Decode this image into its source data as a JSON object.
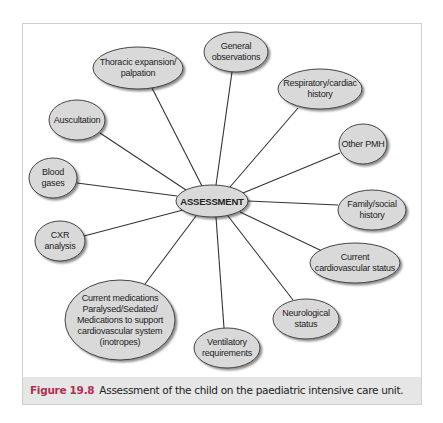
{
  "figure": {
    "number": "Figure 19.8",
    "caption": "Assessment of the child on the paediatric intensive care unit."
  },
  "colors": {
    "node_fill": "#d9d9d9",
    "node_stroke": "#333333",
    "edge": "#333333",
    "caption_number": "#b03050",
    "caption_band": "#e6e6e6"
  },
  "diagram": {
    "hub": {
      "label": "ASSESSMENT",
      "cx": 212,
      "cy": 201,
      "rx": 36,
      "ry": 16
    },
    "nodes": [
      {
        "id": "general-observations",
        "lines": [
          "General",
          "observations"
        ],
        "cx": 236,
        "cy": 52,
        "rx": 32,
        "ry": 20
      },
      {
        "id": "thoracic-expansion",
        "lines": [
          "Thoracic expansion/",
          "palpation"
        ],
        "cx": 138,
        "cy": 68,
        "rx": 45,
        "ry": 21
      },
      {
        "id": "respiratory-cardiac-history",
        "lines": [
          "Respiratory/cardiac",
          "history"
        ],
        "cx": 320,
        "cy": 89,
        "rx": 42,
        "ry": 20
      },
      {
        "id": "auscultation",
        "lines": [
          "Auscultation"
        ],
        "cx": 77,
        "cy": 120,
        "rx": 28,
        "ry": 20
      },
      {
        "id": "other-pmh",
        "lines": [
          "Other PMH"
        ],
        "cx": 363,
        "cy": 144,
        "rx": 24,
        "ry": 20
      },
      {
        "id": "blood-gases",
        "lines": [
          "Blood",
          "gases"
        ],
        "cx": 53,
        "cy": 178,
        "rx": 24,
        "ry": 20
      },
      {
        "id": "family-social-history",
        "lines": [
          "Family/social",
          "history"
        ],
        "cx": 372,
        "cy": 210,
        "rx": 34,
        "ry": 20
      },
      {
        "id": "cxr-analysis",
        "lines": [
          "CXR",
          "analysis"
        ],
        "cx": 60,
        "cy": 241,
        "rx": 25,
        "ry": 20
      },
      {
        "id": "current-cardiovascular-status",
        "lines": [
          "Current",
          "cardiovascular status"
        ],
        "cx": 355,
        "cy": 263,
        "rx": 45,
        "ry": 20
      },
      {
        "id": "neurological-status",
        "lines": [
          "Neurological",
          "status"
        ],
        "cx": 306,
        "cy": 319,
        "rx": 33,
        "ry": 20
      },
      {
        "id": "current-medications",
        "lines": [
          "Current medications",
          "Paralysed/Sedated/",
          "Medications to support",
          "cardiovascular system",
          "(inotropes)"
        ],
        "cx": 120,
        "cy": 320,
        "rx": 55,
        "ry": 40
      },
      {
        "id": "ventilatory-requirements",
        "lines": [
          "Ventilatory",
          "requirements"
        ],
        "cx": 227,
        "cy": 348,
        "rx": 33,
        "ry": 20
      }
    ],
    "edges": [
      {
        "to": "general-observations",
        "x1": 216,
        "y1": 185,
        "x2": 232,
        "y2": 72
      },
      {
        "to": "thoracic-expansion",
        "x1": 202,
        "y1": 186,
        "x2": 152,
        "y2": 88
      },
      {
        "to": "respiratory-cardiac-history",
        "x1": 230,
        "y1": 187,
        "x2": 298,
        "y2": 108
      },
      {
        "to": "auscultation",
        "x1": 186,
        "y1": 190,
        "x2": 100,
        "y2": 133
      },
      {
        "to": "other-pmh",
        "x1": 243,
        "y1": 193,
        "x2": 340,
        "y2": 153
      },
      {
        "to": "blood-gases",
        "x1": 177,
        "y1": 196,
        "x2": 77,
        "y2": 183
      },
      {
        "to": "family-social-history",
        "x1": 248,
        "y1": 201,
        "x2": 338,
        "y2": 205
      },
      {
        "to": "cxr-analysis",
        "x1": 183,
        "y1": 210,
        "x2": 84,
        "y2": 236
      },
      {
        "to": "current-cardiovascular-status",
        "x1": 240,
        "y1": 212,
        "x2": 322,
        "y2": 251
      },
      {
        "to": "neurological-status",
        "x1": 228,
        "y1": 216,
        "x2": 293,
        "y2": 300
      },
      {
        "to": "current-medications",
        "x1": 196,
        "y1": 216,
        "x2": 145,
        "y2": 284
      },
      {
        "to": "ventilatory-requirements",
        "x1": 216,
        "y1": 217,
        "x2": 224,
        "y2": 328
      }
    ]
  }
}
